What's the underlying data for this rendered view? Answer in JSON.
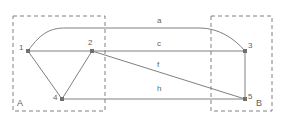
{
  "figure": {
    "type": "graph-diagram",
    "background_color": "#ffffff",
    "stroke_color": "#808080",
    "text_color": "#5f5f5f",
    "width": 285,
    "height": 123
  },
  "regions": [
    {
      "id": "A",
      "label": "A",
      "label_x": 17,
      "label_y": 99,
      "x": 13,
      "y": 16,
      "width": 92,
      "height": 95,
      "style": "dashed"
    },
    {
      "id": "B",
      "label": "B",
      "label_x": 256,
      "label_y": 99,
      "x": 211,
      "y": 16,
      "width": 61,
      "height": 95,
      "style": "dashed"
    }
  ],
  "nodes": [
    {
      "id": "1",
      "label": "1",
      "x": 28,
      "y": 51,
      "label_x": 19,
      "label_y": 44
    },
    {
      "id": "2",
      "label": "2",
      "x": 92,
      "y": 51,
      "label_x": 88,
      "label_y": 39
    },
    {
      "id": "3",
      "label": "3",
      "x": 245,
      "y": 51,
      "label_x": 248,
      "label_y": 42
    },
    {
      "id": "4",
      "label": "4",
      "x": 62,
      "y": 99,
      "label_x": 53,
      "label_y": 94
    },
    {
      "id": "5",
      "label": "5",
      "x": 245,
      "y": 99,
      "label_x": 248,
      "label_y": 93
    }
  ],
  "edges": [
    {
      "id": "a",
      "label": "a",
      "from": "1",
      "to": "3",
      "shape": "curve-top",
      "label_x": 157,
      "label_y": 17
    },
    {
      "id": "c",
      "label": "c",
      "from": "1",
      "to": "3",
      "shape": "straight",
      "label_x": 157,
      "label_y": 40
    },
    {
      "id": "f",
      "label": "f",
      "from": "2",
      "to": "5",
      "shape": "straight",
      "label_x": 157,
      "label_y": 61
    },
    {
      "id": "h",
      "label": "h",
      "from": "4",
      "to": "5",
      "shape": "straight",
      "label_x": 157,
      "label_y": 85
    },
    {
      "id": "e14",
      "label": "",
      "from": "1",
      "to": "4",
      "shape": "straight",
      "label_x": 0,
      "label_y": 0
    },
    {
      "id": "e42",
      "label": "",
      "from": "4",
      "to": "2",
      "shape": "straight",
      "label_x": 0,
      "label_y": 0
    },
    {
      "id": "e35",
      "label": "",
      "from": "3",
      "to": "5",
      "shape": "straight",
      "label_x": 0,
      "label_y": 0
    }
  ]
}
